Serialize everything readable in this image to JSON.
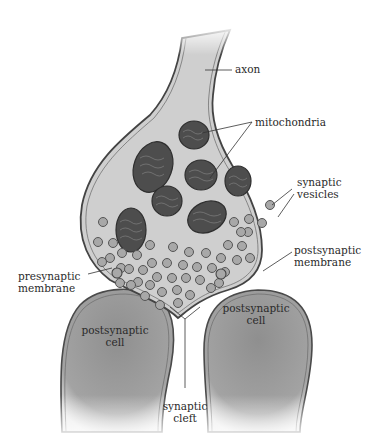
{
  "diagram": {
    "labels": {
      "axon": "axon",
      "mitochondria": "mitochondria",
      "synaptic_vesicles": [
        "synaptic",
        "vesicles"
      ],
      "postsynaptic_membrane": [
        "postsynaptic",
        "membrane"
      ],
      "presynaptic_membrane": [
        "presynaptic",
        "membrane"
      ],
      "postsynaptic_cell_left": [
        "postsynaptic",
        "cell"
      ],
      "postsynaptic_cell_right": [
        "postsynaptic",
        "cell"
      ],
      "synaptic_cleft": [
        "synaptic",
        "cleft"
      ]
    },
    "colors": {
      "cytoplasm": "#cfcfcf",
      "membrane": "#4a4a4a",
      "mitochondrion": "#4d4d4d",
      "vesicle_fill": "#a8a8a8",
      "postsynaptic_cell": "#9a9a9a",
      "background": "#ffffff"
    }
  }
}
